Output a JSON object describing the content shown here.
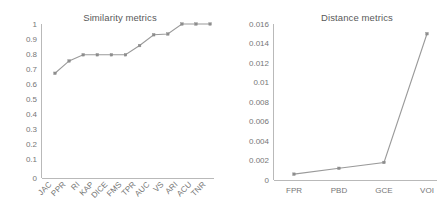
{
  "figure": {
    "background": "#ffffff",
    "line_color": "#9a9a9a",
    "marker_color": "#8d8d8d",
    "axis_color": "#b9b9b9",
    "text_color": "#767676"
  },
  "chart_data": [
    {
      "type": "line",
      "title": "Similarity metrics",
      "xlabel": "",
      "ylabel": "",
      "categories": [
        "JAC",
        "PPR",
        "RI",
        "KAP",
        "DICE",
        "FMS",
        "TPR",
        "AUC",
        "VS",
        "ARI",
        "ACU",
        "TNR"
      ],
      "values": [
        0.68,
        0.76,
        0.8,
        0.8,
        0.8,
        0.8,
        0.86,
        0.93,
        0.935,
        1.0,
        1.0,
        1.0
      ],
      "ylim": [
        0,
        1
      ],
      "yticks": [
        0,
        0.1,
        0.2,
        0.3,
        0.4,
        0.5,
        0.6,
        0.7,
        0.8,
        0.9,
        1
      ],
      "ytick_labels": [
        "0",
        "0.1",
        "0.2",
        "0.3",
        "0.4",
        "0.5",
        "0.6",
        "0.7",
        "0.8",
        "0.9",
        "1"
      ],
      "grid": false,
      "legend": false,
      "xtick_rotation": 45
    },
    {
      "type": "line",
      "title": "Distance metrics",
      "xlabel": "",
      "ylabel": "",
      "categories": [
        "FPR",
        "PBD",
        "GCE",
        "VOI"
      ],
      "values": [
        0.0006,
        0.0012,
        0.0018,
        0.015
      ],
      "ylim": [
        0,
        0.016
      ],
      "yticks": [
        0,
        0.002,
        0.004,
        0.006,
        0.008,
        0.01,
        0.012,
        0.014,
        0.016
      ],
      "ytick_labels": [
        "0",
        "0.002",
        "0.004",
        "0.006",
        "0.008",
        "0.01",
        "0.012",
        "0.014",
        "0.016"
      ],
      "grid": false,
      "legend": false,
      "xtick_rotation": 0
    }
  ]
}
